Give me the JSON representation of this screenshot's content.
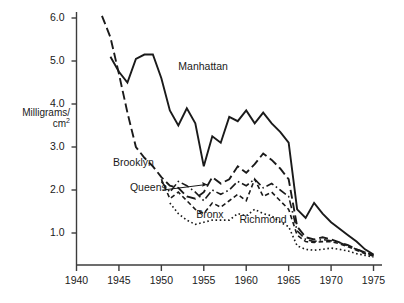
{
  "chart_data": {
    "type": "line",
    "title": "",
    "subtitle": "",
    "xlabel": "",
    "ylabel": "Milligrams/cm²",
    "ylabel_line1": "Milligrams/",
    "ylabel_line2": "cm",
    "ylabel_exponent": "2",
    "xlim": [
      1940,
      1976
    ],
    "ylim": [
      0,
      6.4
    ],
    "grid": false,
    "legend_position": "inline-annotations",
    "x_tick_labels": [
      "1940",
      "1945",
      "1950",
      "1955",
      "1960",
      "1965",
      "1970",
      "1975"
    ],
    "x_ticks": [
      1940,
      1945,
      1950,
      1955,
      1960,
      1965,
      1970,
      1975
    ],
    "y_tick_labels": [
      "1.0",
      "2.0",
      "3.0",
      "4.0",
      "5.0",
      "6.0"
    ],
    "y_ticks": [
      1.0,
      2.0,
      3.0,
      4.0,
      5.0,
      6.0
    ],
    "annotations": [
      {
        "text": "Manhattan",
        "x": 1952.0,
        "y": 4.85
      },
      {
        "text": "Brooklyn",
        "x": 1944.3,
        "y": 2.62
      },
      {
        "text": "Queens",
        "x": 1946.3,
        "y": 2.05
      },
      {
        "text": "Bronx",
        "x": 1954.1,
        "y": 1.42
      },
      {
        "text": "Richmond",
        "x": 1959.2,
        "y": 1.3
      }
    ],
    "series": [
      {
        "name": "Manhattan",
        "style": "solid",
        "x": [
          1944,
          1945,
          1946,
          1947,
          1948,
          1949,
          1950,
          1951,
          1952,
          1953,
          1954,
          1955,
          1956,
          1957,
          1958,
          1959,
          1960,
          1961,
          1962,
          1963,
          1964,
          1965,
          1966,
          1967,
          1968,
          1969,
          1970,
          1971,
          1972,
          1973,
          1974,
          1975
        ],
        "y": [
          5.1,
          4.75,
          4.5,
          5.05,
          5.15,
          5.15,
          4.6,
          3.85,
          3.5,
          3.9,
          3.55,
          2.55,
          3.25,
          3.1,
          3.7,
          3.6,
          3.85,
          3.55,
          3.8,
          3.55,
          3.35,
          3.1,
          1.55,
          1.35,
          1.7,
          1.45,
          1.25,
          1.1,
          0.95,
          0.8,
          0.62,
          0.5
        ]
      },
      {
        "name": "Brooklyn",
        "style": "long-dash",
        "x": [
          1943,
          1944,
          1945,
          1946,
          1947,
          1948,
          1949,
          1950,
          1951,
          1952,
          1953,
          1954,
          1955,
          1956,
          1957,
          1958,
          1959,
          1960,
          1961,
          1962,
          1963,
          1964,
          1965,
          1966,
          1967,
          1968,
          1969,
          1970,
          1971,
          1972,
          1973,
          1974,
          1975
        ],
        "y": [
          6.05,
          5.55,
          4.7,
          3.8,
          3.0,
          2.75,
          2.55,
          2.3,
          2.1,
          2.05,
          1.85,
          1.8,
          1.95,
          2.3,
          2.15,
          2.25,
          2.55,
          2.4,
          2.6,
          2.85,
          2.7,
          2.5,
          2.25,
          1.15,
          0.9,
          0.85,
          0.9,
          0.85,
          0.78,
          0.72,
          0.62,
          0.55,
          0.48
        ]
      },
      {
        "name": "Queens",
        "style": "dash-dot",
        "x": [
          1950,
          1951,
          1952,
          1953,
          1954,
          1955,
          1956,
          1957,
          1958,
          1959,
          1960,
          1961,
          1962,
          1963,
          1964,
          1965,
          1966,
          1967,
          1968,
          1969,
          1970,
          1971,
          1972,
          1973,
          1974,
          1975
        ],
        "y": [
          2.2,
          1.95,
          2.2,
          2.1,
          1.95,
          1.75,
          2.0,
          1.9,
          2.0,
          2.2,
          2.1,
          2.25,
          2.05,
          2.15,
          2.0,
          1.85,
          1.05,
          0.85,
          0.8,
          0.85,
          0.82,
          0.78,
          0.7,
          0.62,
          0.55,
          0.48
        ]
      },
      {
        "name": "Bronx",
        "style": "short-dash",
        "x": [
          1950,
          1951,
          1952,
          1953,
          1954,
          1955,
          1956,
          1957,
          1958,
          1959,
          1960,
          1961,
          1962,
          1963,
          1964,
          1965,
          1966,
          1967,
          1968,
          1969,
          1970,
          1971,
          1972,
          1973,
          1974,
          1975
        ],
        "y": [
          2.25,
          1.8,
          1.95,
          1.75,
          1.55,
          1.45,
          1.7,
          1.6,
          1.75,
          1.9,
          1.75,
          2.25,
          1.85,
          1.95,
          1.75,
          1.55,
          0.95,
          0.8,
          0.78,
          0.8,
          0.8,
          0.75,
          0.68,
          0.6,
          0.52,
          0.46
        ]
      },
      {
        "name": "Richmond",
        "style": "dotted",
        "x": [
          1951,
          1952,
          1953,
          1954,
          1955,
          1956,
          1957,
          1958,
          1959,
          1960,
          1961,
          1962,
          1963,
          1964,
          1965,
          1966,
          1967,
          1968,
          1969,
          1970,
          1971,
          1972,
          1973,
          1974,
          1975
        ],
        "y": [
          1.7,
          1.45,
          1.3,
          1.2,
          1.25,
          1.3,
          1.3,
          1.3,
          1.45,
          1.4,
          1.55,
          1.45,
          1.4,
          1.25,
          1.15,
          0.7,
          0.62,
          0.6,
          0.62,
          0.65,
          0.62,
          0.58,
          0.52,
          0.48,
          0.44
        ]
      }
    ]
  },
  "style": {
    "line_color": "#1a1a1a",
    "axis_color": "#3c3c3c",
    "background": "#ffffff"
  }
}
